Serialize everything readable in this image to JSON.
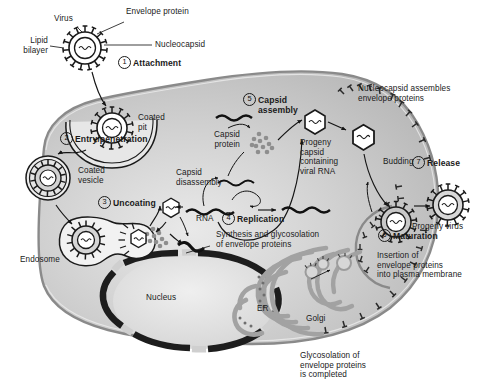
{
  "figure": {
    "colors": {
      "cytoplasm": "#b9b9b9",
      "cytoplasm_light": "#d8d8d8",
      "membrane": "#8f8f8f",
      "nucleus_envelope": "#1d1d1d",
      "nucleus_interior": "#e2e2e2",
      "organelle": "#a8a8a8",
      "stroke": "#1a1a1a",
      "virus_fill": "#ffffff",
      "background": "#ffffff"
    }
  },
  "callouts": {
    "virus": "Virus",
    "envelope_protein": "Envelope protein",
    "nucleocapsid": "Nucleocapsid",
    "lipid_bilayer": "Lipid\nbilayer",
    "coated_pit": "Coated\npit",
    "coated_vesicle": "Coated\nvesicle",
    "endosome": "Endosome",
    "nucleus": "Nucleus",
    "er": "ER",
    "golgi": "Golgi",
    "capsid_disassembly": "Capsid\ndisassembly",
    "rna": "RNA",
    "capsid_protein": "Capsid\nprotein",
    "progeny_capsid": "Progeny\ncapsid\ncontaining\nviral RNA",
    "nucleocapsid_assembles": "Nucleocapsid assembles\nenvelope proteins",
    "budding": "Budding",
    "progeny_virus": "Progeny virus",
    "synthesis_glyco": "Synthesis and glycosolation\nof envelope proteins",
    "insertion": "Insertion of\nenvelope proteins\ninto plasma membrane",
    "glyco_completed": "Glycosolation of\nenvelope proteins\nis completed"
  },
  "steps": [
    {
      "number": "1",
      "label": "Attachment"
    },
    {
      "number": "2",
      "label": "Entry/penetration"
    },
    {
      "number": "3",
      "label": "Uncoating"
    },
    {
      "number": "4",
      "label": "Replication"
    },
    {
      "number": "5",
      "label": "Capsid\nassembly"
    },
    {
      "number": "6",
      "label": "Maturation"
    },
    {
      "number": "7",
      "label": "Release"
    }
  ]
}
